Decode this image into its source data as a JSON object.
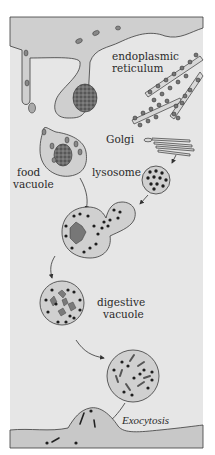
{
  "figure": {
    "type": "biology-diagram",
    "colors": {
      "background": "#e4e4e4",
      "outer_white": "#ffffff",
      "cytoplasm_band": "#cfcfcf",
      "vesicle_fill": "#d0d0d0",
      "outline": "#3a3a3a",
      "dots": "#1e1e1e",
      "food_particle": "#7a7a7a"
    }
  },
  "labels": {
    "er": [
      "endoplasmic",
      "reticulum"
    ],
    "golgi": "Golgi",
    "food_vacuole": [
      "food",
      "vacuole"
    ],
    "lysosome": "lysosome",
    "digestive_vacuole": [
      "digestive",
      "vacuole"
    ],
    "exocytosis": "Exocytosis"
  }
}
